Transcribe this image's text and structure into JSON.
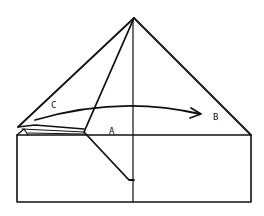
{
  "diagram": {
    "type": "origami-fold-step",
    "stroke_color": "#111111",
    "background": "#ffffff",
    "labels": [
      {
        "id": "C",
        "text": "C",
        "x": 51,
        "y": 101
      },
      {
        "id": "A",
        "text": "A",
        "x": 109,
        "y": 127
      },
      {
        "id": "B",
        "text": "B",
        "x": 213,
        "y": 113
      }
    ],
    "arrow": {
      "from": "C",
      "to": "B",
      "direction": "right",
      "style": "curved"
    }
  }
}
